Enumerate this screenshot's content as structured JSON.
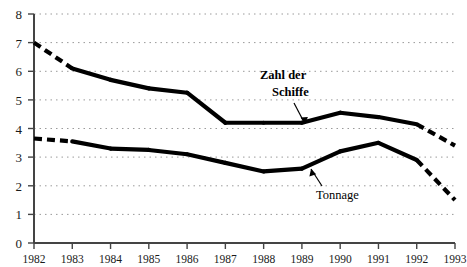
{
  "chart_data": {
    "type": "line",
    "title": "",
    "xlabel": "",
    "ylabel": "",
    "x": [
      1982,
      1983,
      1984,
      1985,
      1986,
      1987,
      1988,
      1989,
      1990,
      1991,
      1992,
      1993
    ],
    "categories": [
      "1982",
      "1983",
      "1984",
      "1985",
      "1986",
      "1987",
      "1988",
      "1989",
      "1990",
      "1991",
      "1992",
      "1993"
    ],
    "xlim": [
      1982,
      1993
    ],
    "ylim": [
      0,
      8
    ],
    "yticks": [
      0,
      1,
      2,
      3,
      4,
      5,
      6,
      7,
      8
    ],
    "ytick_labels": [
      "0",
      "1",
      "2",
      "3",
      "4",
      "5",
      "6",
      "7",
      "8"
    ],
    "grid": "horizontal-dotted",
    "legend": "inline-annotations",
    "series": [
      {
        "name": "Zahl der Schiffe",
        "values": [
          7.0,
          6.1,
          5.7,
          5.4,
          5.25,
          4.2,
          4.2,
          4.2,
          4.55,
          4.4,
          4.15,
          3.4
        ],
        "dashed_segments": [
          [
            1982,
            1983
          ],
          [
            1992,
            1993
          ]
        ],
        "color": "#000000"
      },
      {
        "name": "Tonnage",
        "values": [
          3.65,
          3.55,
          3.3,
          3.25,
          3.1,
          2.8,
          2.5,
          2.6,
          3.2,
          3.5,
          2.9,
          1.5
        ],
        "dashed_segments": [
          [
            1982,
            1983
          ],
          [
            1992,
            1993
          ]
        ],
        "color": "#000000"
      }
    ],
    "annotations": [
      {
        "name": "zahl-der-schiffe",
        "text_line1": "Zahl der",
        "text_line2": "Schiffe",
        "points_to_year": 1989
      },
      {
        "name": "tonnage",
        "text_line1": "Tonnage",
        "text_line2": "",
        "points_to_year": 1989
      }
    ]
  }
}
